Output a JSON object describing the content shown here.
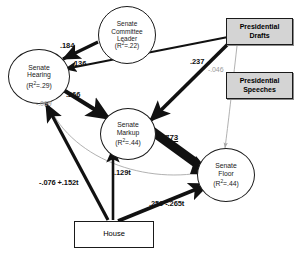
{
  "diagram": {
    "type": "path-diagram",
    "nodes": [
      {
        "id": "senate-committee-leader",
        "shape": "ellipse",
        "label": "Senate\nCommittee\nLeader",
        "line1": "Senate",
        "line2": "Committee",
        "line3": "Leader",
        "r2_prefix": "(R",
        "r2_sup": "2",
        "r2_suffix": "=.22)",
        "r2_value": 0.22
      },
      {
        "id": "senate-hearing",
        "shape": "ellipse",
        "line1": "Senate",
        "line2": "Hearing",
        "r2_prefix": "(R",
        "r2_sup": "2",
        "r2_suffix": "=.29)",
        "r2_value": 0.29
      },
      {
        "id": "senate-markup",
        "shape": "ellipse",
        "line1": "Senate",
        "line2": "Markup",
        "r2_prefix": "(R",
        "r2_sup": "2",
        "r2_suffix": "=.44)",
        "r2_value": 0.44
      },
      {
        "id": "senate-floor",
        "shape": "ellipse",
        "line1": "Senate",
        "line2": "Floor",
        "r2_prefix": "(R",
        "r2_sup": "2",
        "r2_suffix": "=.44)",
        "r2_value": 0.44
      },
      {
        "id": "presidential-drafts",
        "shape": "rect",
        "line1": "Presidential",
        "line2": "Drafts"
      },
      {
        "id": "presidential-speeches",
        "shape": "rect",
        "line1": "Presidential",
        "line2": "Speeches"
      },
      {
        "id": "house",
        "shape": "rect",
        "line1": "House"
      }
    ],
    "edges": [
      {
        "id": "leader-to-hearing",
        "from": "senate-committee-leader",
        "to": "senate-hearing",
        "coefficient": ".184",
        "style": "bold-black"
      },
      {
        "id": "drafts-to-hearing",
        "from": "presidential-drafts",
        "to": "senate-hearing",
        "coefficient": ".136",
        "style": "black"
      },
      {
        "id": "hearing-to-markup",
        "from": "senate-hearing",
        "to": "senate-markup",
        "coefficient": ".266",
        "style": "bold-black"
      },
      {
        "id": "hearing-to-floor",
        "from": "senate-hearing",
        "to": "senate-floor",
        "coefficient": "-.069",
        "style": "thin-gray"
      },
      {
        "id": "drafts-to-markup",
        "from": "presidential-drafts",
        "to": "senate-markup",
        "coefficient": ".237",
        "style": "bold-black"
      },
      {
        "id": "drafts-to-floor",
        "from": "presidential-drafts",
        "to": "senate-floor",
        "coefficient": "-.046",
        "style": "thin-gray"
      },
      {
        "id": "markup-to-floor",
        "from": "senate-markup",
        "to": "senate-floor",
        "coefficient": ".773",
        "style": "heavy-black"
      },
      {
        "id": "house-to-hearing",
        "from": "house",
        "to": "senate-hearing",
        "coefficient": "-.076 +.152t",
        "style": "bold-black"
      },
      {
        "id": "house-to-markup",
        "from": "house",
        "to": "senate-markup",
        "coefficient": ".129t",
        "style": "bold-black"
      },
      {
        "id": "house-to-floor",
        "from": "house",
        "to": "senate-floor",
        "coefficient": ".259 -.265t",
        "style": "bold-black"
      }
    ],
    "colors": {
      "stroke": "#111111",
      "faint_stroke": "#a8a8a8",
      "box_fill": "#d4d4d4",
      "circle_fill": "#ffffff",
      "background": "#ffffff"
    }
  }
}
